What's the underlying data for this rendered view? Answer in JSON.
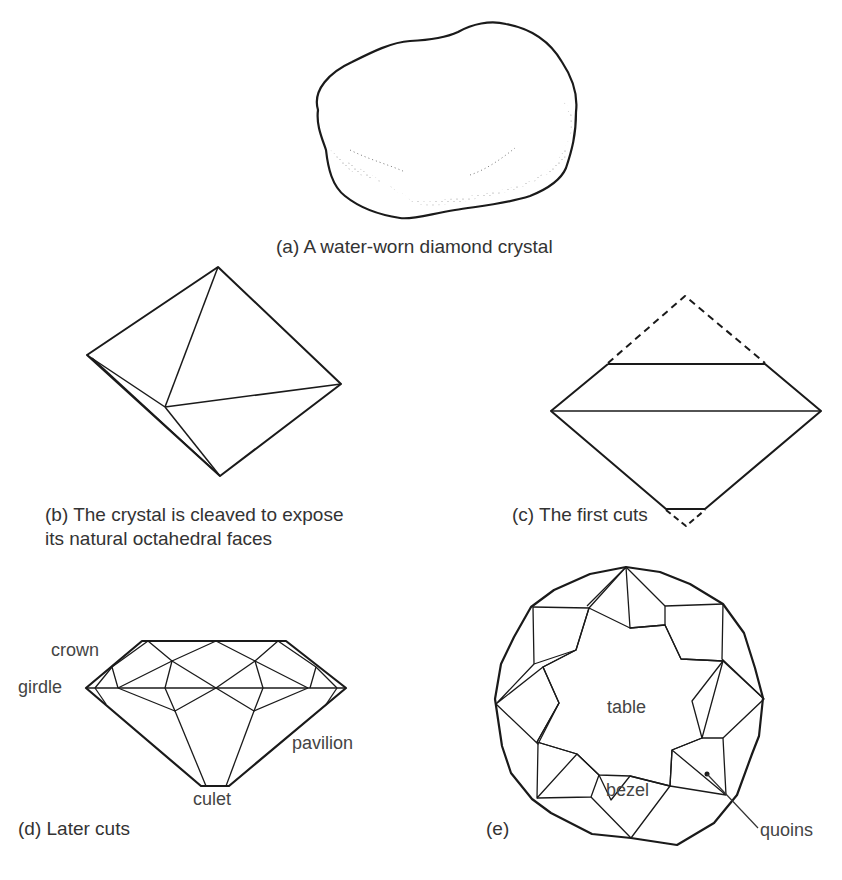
{
  "figures": {
    "a": {
      "caption": "(a) A water-worn diamond crystal"
    },
    "b": {
      "caption_line1": "(b) The crystal is cleaved to expose",
      "caption_line2": "its natural octahedral faces"
    },
    "c": {
      "caption": "(c) The first cuts"
    },
    "d": {
      "caption": "(d) Later cuts",
      "labels": {
        "crown": "crown",
        "girdle": "girdle",
        "pavilion": "pavilion",
        "culet": "culet"
      }
    },
    "e": {
      "caption": "(e)",
      "labels": {
        "table": "table",
        "bezel": "bezel",
        "quoins": "quoins"
      }
    }
  },
  "colors": {
    "line": "#1a1a1a",
    "text": "#333333",
    "background": "#ffffff"
  }
}
